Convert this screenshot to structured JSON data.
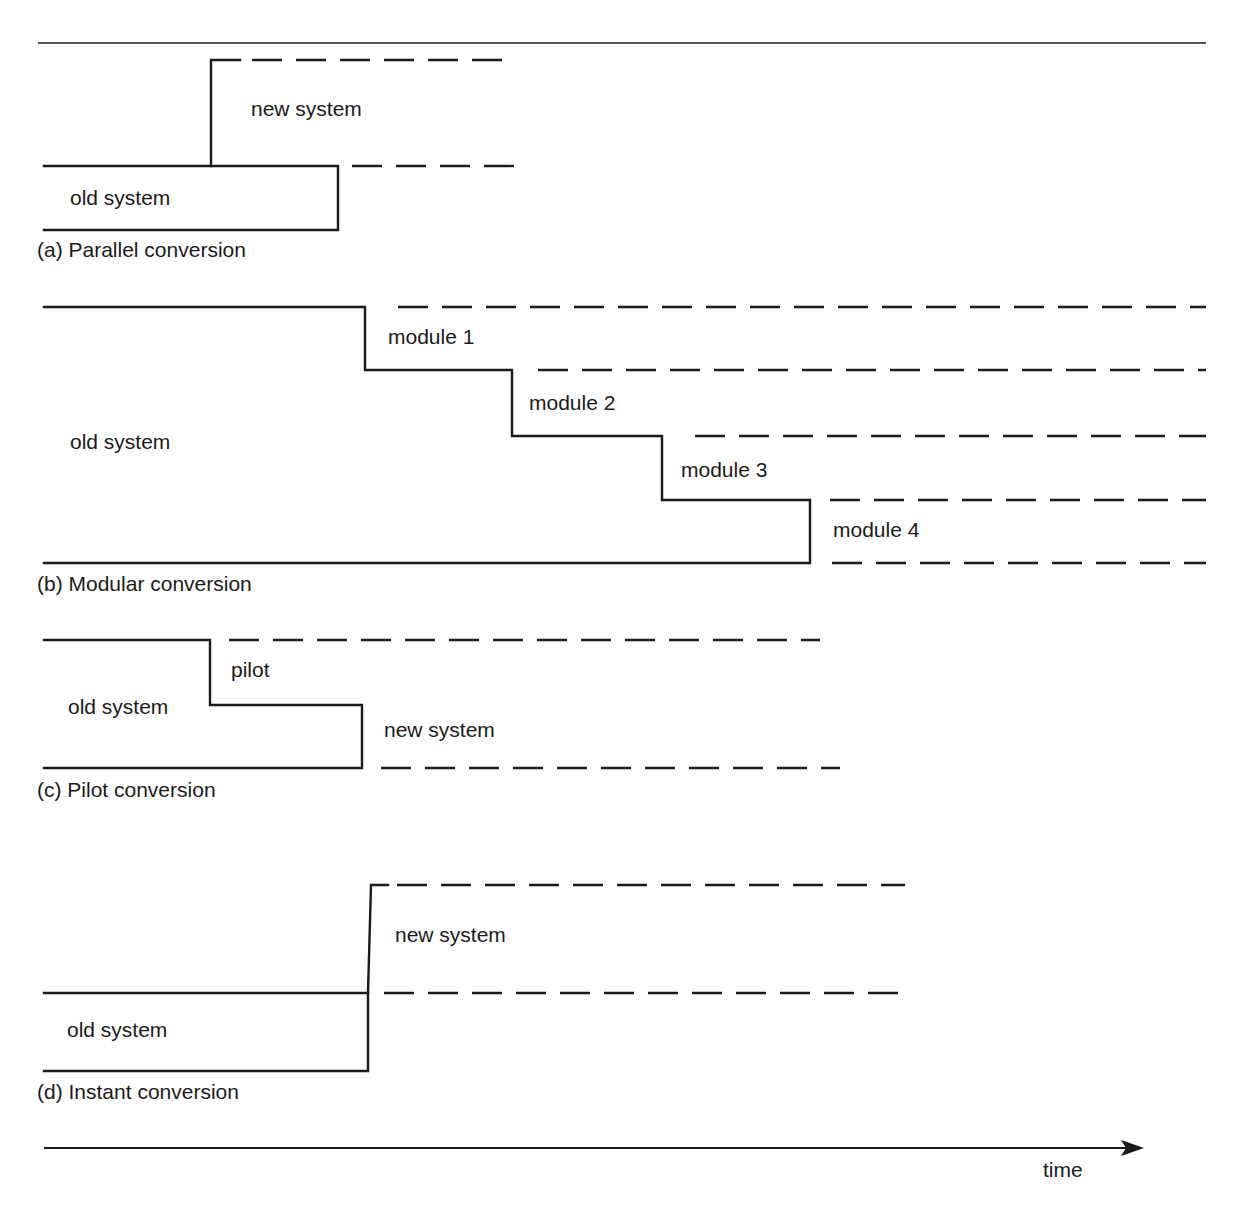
{
  "diagram": {
    "panels": [
      {
        "id": "a",
        "caption": "(a) Parallel conversion",
        "labels": {
          "new": "new system",
          "old": "old system"
        }
      },
      {
        "id": "b",
        "caption": "(b) Modular conversion",
        "labels": {
          "old": "old system",
          "m1": "module 1",
          "m2": "module 2",
          "m3": "module 3",
          "m4": "module 4"
        }
      },
      {
        "id": "c",
        "caption": "(c) Pilot conversion",
        "labels": {
          "old": "old system",
          "pilot": "pilot",
          "new": "new system"
        }
      },
      {
        "id": "d",
        "caption": "(d) Instant conversion",
        "labels": {
          "new": "new system",
          "old": "old system"
        }
      }
    ],
    "axis": {
      "label": "time"
    },
    "colors": {
      "line": "#1a1a1a",
      "background": "#ffffff"
    }
  }
}
